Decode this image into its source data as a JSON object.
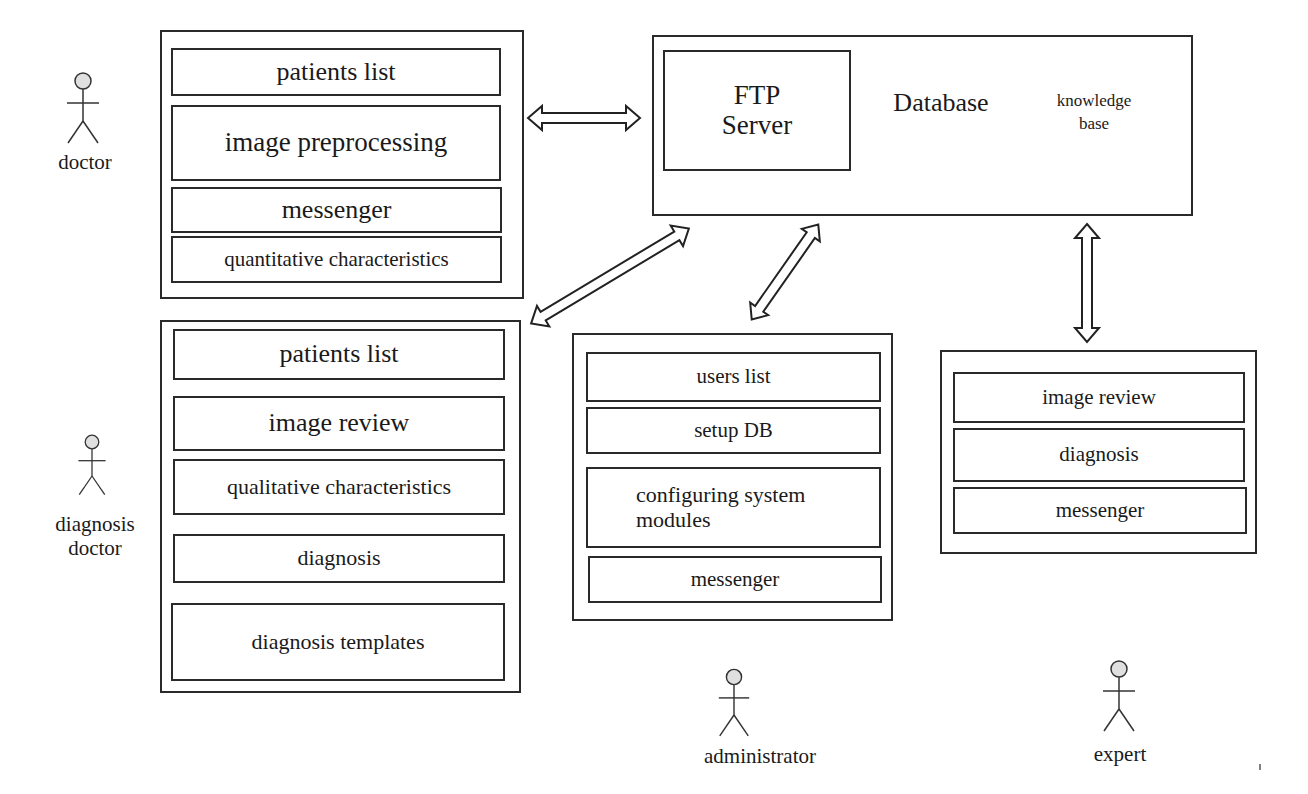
{
  "actors": {
    "doctor": {
      "label": "doctor"
    },
    "diagnosis_doctor": {
      "label_line1": "diagnosis",
      "label_line2": "doctor"
    },
    "administrator": {
      "label": "administrator"
    },
    "expert": {
      "label": "expert"
    }
  },
  "doctor_panel": {
    "items": [
      {
        "label": "patients list"
      },
      {
        "label": "image preprocessing"
      },
      {
        "label": "messenger"
      },
      {
        "label": "quantitative characteristics"
      }
    ]
  },
  "server_panel": {
    "ftp_line1": "FTP",
    "ftp_line2": "Server",
    "database": "Database",
    "knowledge_line1": "knowledge",
    "knowledge_line2": "base"
  },
  "diagnosis_panel": {
    "items": [
      {
        "label": "patients list"
      },
      {
        "label": "image review"
      },
      {
        "label": "qualitative characteristics"
      },
      {
        "label": "diagnosis"
      },
      {
        "label": "diagnosis templates"
      }
    ]
  },
  "admin_panel": {
    "items": [
      {
        "label": "users list"
      },
      {
        "label": "setup DB"
      },
      {
        "label_line1": "configuring system",
        "label_line2": "modules"
      },
      {
        "label": "messenger"
      }
    ]
  },
  "expert_panel": {
    "items": [
      {
        "label": "image review"
      },
      {
        "label": "diagnosis"
      },
      {
        "label": "messenger"
      }
    ]
  }
}
